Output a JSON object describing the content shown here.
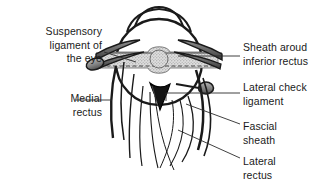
{
  "figure": {
    "background_color": "#ffffff",
    "ink_color": "#1a1a1a",
    "labels": [
      {
        "id": "suspensory-ligament",
        "text": "Suspensory\nligament of\nthe eye",
        "align": "right",
        "leader_from": [
          104,
          52
        ],
        "leader_to": [
          136,
          62
        ]
      },
      {
        "id": "medial-rectus",
        "text": "Medial\nrectus",
        "align": "right",
        "leader_from": [
          76,
          100
        ],
        "leader_to": [
          110,
          100
        ]
      },
      {
        "id": "sheath-around-inferior-rectus",
        "text": "Sheath aroud\ninferior rectus",
        "align": "left",
        "leader_from": [
          240,
          56
        ],
        "leader_to": [
          178,
          56
        ]
      },
      {
        "id": "lateral-check-ligament",
        "text": "Lateral check\nligament",
        "align": "left",
        "leader_from": [
          240,
          93
        ],
        "leader_to": [
          200,
          93
        ]
      },
      {
        "id": "fascial-sheath",
        "text": "Fascial\nsheath",
        "align": "left",
        "leader_from": [
          240,
          124
        ],
        "leader_to": [
          185,
          106
        ]
      },
      {
        "id": "lateral-rectus",
        "text": "Lateral\nrectus",
        "align": "left",
        "leader_from": [
          240,
          158
        ],
        "leader_to": [
          178,
          132
        ]
      }
    ],
    "colors": {
      "outline": "#1a1a1a",
      "muscle_fill": "#6b6b6b",
      "muscle_fill_light": "#9a9a9a",
      "globe_fill": "#ffffff",
      "sheath_band": "#d8d8d8",
      "sheath_band_stipple": "#8f8f8f",
      "dark_wedge": "#141414",
      "leader_line": "#2b2b2b"
    },
    "structures": [
      {
        "name": "eyeball-globe",
        "description": "Large circular globe of the eye, white fill with dark outline"
      },
      {
        "name": "cornea-bulge",
        "description": "Anterior corneal dome projecting from the top of the globe"
      },
      {
        "name": "fascial-sheath-band",
        "description": "Horizontal stippled grey band crossing the globe with a central bulge and dashed midline"
      },
      {
        "name": "medial-check-ligament-stub",
        "description": "Rounded grey cylindrical stub on the left at the end of the medial check ligament"
      },
      {
        "name": "lateral-check-ligament-stub",
        "description": "Rounded grey cylindrical stub on the right at the end of the lateral check ligament"
      },
      {
        "name": "inferior-rectus-attachment",
        "description": "Dark wedge at the inferior pole of the globe"
      },
      {
        "name": "medial-rectus-strands",
        "description": "Curved muscle strands descending to the lower left"
      },
      {
        "name": "lateral-rectus-strands",
        "description": "Curved muscle strands descending to the lower right"
      }
    ]
  }
}
